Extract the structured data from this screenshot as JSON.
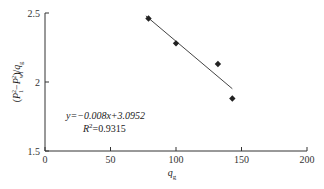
{
  "chart_data": {
    "type": "scatter",
    "title": "",
    "xlabel": "q_g",
    "ylabel": "(P_1^2 − P_wf^2)/q_g",
    "xlim": [
      0,
      200
    ],
    "ylim": [
      1.5,
      2.5
    ],
    "xticks": [
      0,
      50,
      100,
      150,
      200
    ],
    "yticks": [
      1.5,
      2,
      2.5
    ],
    "xtick_labels": [
      "0",
      "50",
      "100",
      "150",
      "200"
    ],
    "ytick_labels": [
      "1.5",
      "2",
      "2.5"
    ],
    "grid": false,
    "legend": null,
    "series": [
      {
        "name": "data",
        "marker": "diamond",
        "color": "#222222",
        "points": [
          {
            "x": 79,
            "y": 2.46
          },
          {
            "x": 100,
            "y": 2.28
          },
          {
            "x": 132,
            "y": 2.13
          },
          {
            "x": 143,
            "y": 1.88
          }
        ]
      }
    ],
    "trendline": {
      "type": "linear",
      "slope": -0.008,
      "intercept": 3.0952,
      "x_range": [
        77,
        143
      ],
      "color": "#444444"
    },
    "annotations": [
      {
        "text_y": "y=−0.008x+3.0952",
        "text_r2": "R²=0.9315"
      }
    ]
  },
  "labels": {
    "equation": "y=−0.008x+3.0952",
    "r2_prefix": "R",
    "r2_sup": "2",
    "r2_value": "=0.9315",
    "xlabel_main": "q",
    "xlabel_sub": "g",
    "ylabel_open": "(P",
    "ylabel_sub1": "1",
    "ylabel_sup1": "2",
    "ylabel_minus": "−P",
    "ylabel_sub2": "wf",
    "ylabel_sup2": "2",
    "ylabel_close": ")/q",
    "ylabel_sub3": "g"
  }
}
